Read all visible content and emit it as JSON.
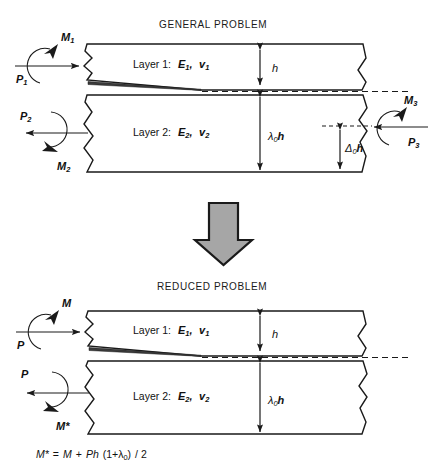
{
  "figure": {
    "width": 441,
    "height": 468,
    "background": "#ffffff",
    "ink_color": "#1a1a1a",
    "arrow_fill": "#a6a6a6"
  },
  "general": {
    "title": "GENERAL PROBLEM",
    "layer1_label": "Layer 1:",
    "layer1_modulus": "E",
    "layer1_modulus_sub": "1",
    "layer1_comma": ",",
    "layer1_poisson": "v",
    "layer1_poisson_sub": "1",
    "layer2_label": "Layer 2:",
    "layer2_modulus": "E",
    "layer2_modulus_sub": "2",
    "layer2_comma": ",",
    "layer2_poisson": "v",
    "layer2_poisson_sub": "2",
    "moment_left_top": "M",
    "moment_left_top_sub": "1",
    "force_left_top": "P",
    "force_left_top_sub": "1",
    "force_left_bottom": "P",
    "force_left_bottom_sub": "2",
    "moment_left_bottom": "M",
    "moment_left_bottom_sub": "2",
    "moment_right": "M",
    "moment_right_sub": "3",
    "force_right": "P",
    "force_right_sub": "3",
    "dim_h": "h",
    "dim_lambda": "λ",
    "dim_lambda_sub": "0",
    "dim_lambda_h": "h",
    "dim_delta": "Δ",
    "dim_delta_sub": "0",
    "dim_delta_h": "h"
  },
  "transition": {
    "icon": "down-block-arrow"
  },
  "reduced": {
    "title": "REDUCED PROBLEM",
    "layer1_label": "Layer 1:",
    "layer1_modulus": "E",
    "layer1_modulus_sub": "1",
    "layer1_comma": ",",
    "layer1_poisson": "v",
    "layer1_poisson_sub": "1",
    "layer2_label": "Layer 2:",
    "layer2_modulus": "E",
    "layer2_modulus_sub": "2",
    "layer2_comma": ",",
    "layer2_poisson": "v",
    "layer2_poisson_sub": "2",
    "moment_top": "M",
    "force_top": "P",
    "force_bottom": "P",
    "moment_bottom": "M*",
    "dim_h": "h",
    "dim_lambda": "λ",
    "dim_lambda_sub": "0",
    "dim_lambda_h": "h"
  },
  "equation": {
    "lhs": "M*",
    "eq": "=",
    "term1": "M",
    "plus": "+",
    "term2": "Ph",
    "paren_open": "(1+",
    "lambda": "λ",
    "lambda_sub": "0",
    "paren_close": ")",
    "divide": "/ 2",
    "full_text": "M* = M + Ph (1+λ0) / 2"
  }
}
